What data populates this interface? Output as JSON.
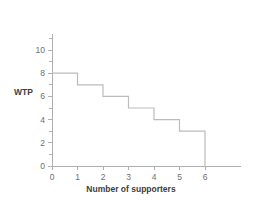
{
  "chart_data": {
    "type": "line",
    "subtype": "step",
    "title": "",
    "xlabel": "Number of supporters",
    "ylabel": "WTP",
    "xlim": [
      0,
      7
    ],
    "ylim": [
      0,
      11
    ],
    "grid": false,
    "legend": null,
    "x_ticks": [
      0,
      1,
      2,
      3,
      4,
      5,
      6
    ],
    "x_tick_labels": [
      "0",
      "1",
      "2",
      "3",
      "4",
      "5",
      "6"
    ],
    "y_ticks": [
      0,
      2,
      4,
      6,
      8,
      10
    ],
    "y_tick_labels": [
      "0",
      "2",
      "4",
      "6",
      "8",
      "10"
    ],
    "y_minor_ticks": [
      1,
      3,
      5,
      7,
      9,
      11
    ],
    "steps": [
      {
        "x_start": 0,
        "x_end": 1,
        "value": 8
      },
      {
        "x_start": 1,
        "x_end": 2,
        "value": 7
      },
      {
        "x_start": 2,
        "x_end": 3,
        "value": 6
      },
      {
        "x_start": 3,
        "x_end": 4,
        "value": 5
      },
      {
        "x_start": 4,
        "x_end": 5,
        "value": 4
      },
      {
        "x_start": 5,
        "x_end": 6,
        "value": 3
      }
    ],
    "x": [
      0,
      1,
      2,
      3,
      4,
      5,
      6
    ],
    "values": [
      8,
      7,
      6,
      5,
      4,
      3,
      0
    ],
    "line_color": "#bcbcbc",
    "axis_color": "#b0b0b0",
    "text_color": "#6e6e6e",
    "title_color": "#3d3d3d",
    "background_color": "#ffffff"
  }
}
